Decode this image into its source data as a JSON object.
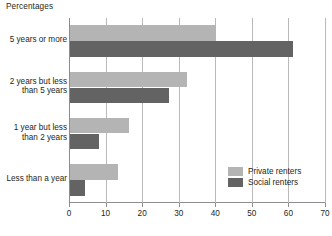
{
  "chart_data": {
    "type": "bar",
    "orientation": "horizontal",
    "title": "Percentages",
    "xlabel": "",
    "ylabel": "",
    "xlim": [
      0,
      70
    ],
    "xticks": [
      0,
      10,
      20,
      30,
      40,
      50,
      60,
      70
    ],
    "xtick_labels": [
      "0",
      "10",
      "20",
      "30",
      "40",
      "50",
      "60",
      "70"
    ],
    "grid": true,
    "grid_axis": "x",
    "legend_position": "bottom-right",
    "categories": [
      "5 years or more",
      "2 years but less than 5 years",
      "1 year but less than 2 years",
      "Less than a year"
    ],
    "category_lines": [
      [
        "5 years or more"
      ],
      [
        "2 years but less",
        "than 5 years"
      ],
      [
        "1 year but less",
        "than 2 years"
      ],
      [
        "Less than a year"
      ]
    ],
    "series": [
      {
        "name": "Private renters",
        "color": "#b4b4b4",
        "values": [
          40,
          32,
          16,
          13
        ]
      },
      {
        "name": "Social renters",
        "color": "#636363",
        "values": [
          61,
          27,
          8,
          4
        ]
      }
    ]
  },
  "legend": {
    "items": [
      {
        "label": "Private renters",
        "color": "#b4b4b4"
      },
      {
        "label": "Social renters",
        "color": "#636363"
      }
    ]
  },
  "axis": {
    "tick_labels": [
      "0",
      "10",
      "20",
      "30",
      "40",
      "50",
      "60",
      "70"
    ]
  },
  "colors": {
    "private": "#b4b4b4",
    "social": "#636363",
    "axis": "#8d8d8d",
    "grid": "#b9b9b9",
    "text": "#231f20",
    "background": "#ffffff"
  }
}
